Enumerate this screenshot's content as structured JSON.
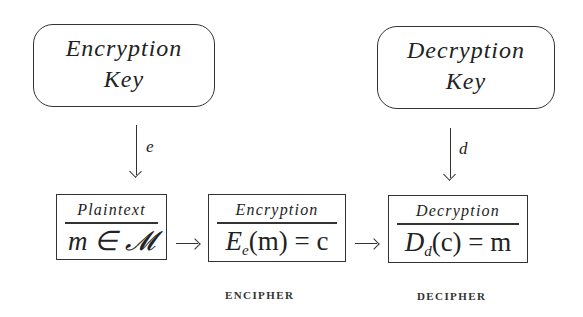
{
  "diagram": {
    "keys": [
      {
        "id": "encryption-key",
        "line1": "Encryption",
        "line2": "Key"
      },
      {
        "id": "decryption-key",
        "line1": "Decryption",
        "line2": "Key"
      }
    ],
    "key_arrows": [
      {
        "label": "e",
        "from": "encryption-key",
        "to": "encryption"
      },
      {
        "label": "d",
        "from": "decryption-key",
        "to": "decryption"
      }
    ],
    "stages": [
      {
        "id": "plaintext",
        "title": "Plaintext",
        "formula": "m ∈ 𝓜"
      },
      {
        "id": "encryption",
        "title": "Encryption",
        "formula_main": "E",
        "formula_sub": "e",
        "formula_rest": "(m) = c"
      },
      {
        "id": "decryption",
        "title": "Decryption",
        "formula_main": "D",
        "formula_sub": "d",
        "formula_rest": "(c) = m"
      }
    ],
    "flow_arrows": [
      "→",
      "→"
    ],
    "captions": [
      "ENCIPHER",
      "DECIPHER"
    ],
    "colors": {
      "stroke": "#333333",
      "text": "#222222",
      "background": "#ffffff"
    }
  }
}
